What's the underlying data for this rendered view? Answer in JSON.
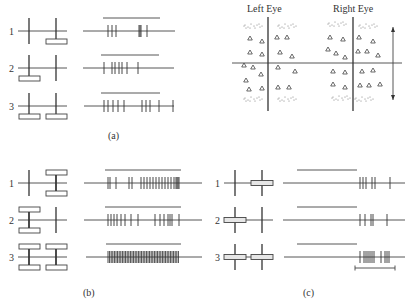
{
  "figure": {
    "panel_labels": {
      "a": "(a)",
      "b": "(b)",
      "c": "(c)"
    },
    "eye_labels": {
      "left": "Left Eye",
      "right": "Right Eye"
    },
    "row_labels": [
      "1",
      "2",
      "3"
    ]
  },
  "panels": {
    "a": {
      "label_pos": [
        115,
        132
      ],
      "rows": [
        {
          "y": 31,
          "label": "1",
          "stim": [
            {
              "x": 29,
              "bar": "none"
            },
            {
              "x": 56,
              "bar": "below"
            }
          ],
          "train": {
            "x1": 83,
            "x2": 175,
            "bar": [
              103,
              160
            ],
            "spikes": [
              108,
              112,
              116,
              139,
              140,
              141,
              147
            ]
          }
        },
        {
          "y": 68,
          "label": "2",
          "stim": [
            {
              "x": 29,
              "bar": "below"
            },
            {
              "x": 56,
              "bar": "none"
            }
          ],
          "train": {
            "x1": 83,
            "x2": 174,
            "bar": [
              101,
              159
            ],
            "spikes": [
              104,
              112,
              115,
              119,
              122,
              127,
              138
            ]
          }
        },
        {
          "y": 106,
          "label": "3",
          "stim": [
            {
              "x": 29,
              "bar": "below"
            },
            {
              "x": 56,
              "bar": "below"
            }
          ],
          "train": {
            "x1": 84,
            "x2": 174,
            "bar": [
              101,
              160
            ],
            "spikes": [
              104,
              108,
              113,
              118,
              124,
              142,
              146,
              150,
              159,
              173
            ]
          }
        }
      ],
      "stim_style": "a"
    },
    "b": {
      "label_pos": [
        90,
        290
      ],
      "rows": [
        {
          "y": 183,
          "label": "1",
          "stim": [
            {
              "x": 29,
              "bar": "none"
            },
            {
              "x": 56,
              "bar": "both"
            }
          ],
          "train": {
            "x1": 84,
            "x2": 202,
            "bar": [
              105,
              181
            ],
            "spikes": [
              108,
              110,
              116,
              129,
              132,
              141,
              144,
              147,
              150,
              153,
              156,
              159,
              162,
              165,
              168,
              171,
              174,
              176,
              177,
              178,
              179
            ]
          }
        },
        {
          "y": 220,
          "label": "2",
          "stim": [
            {
              "x": 29,
              "bar": "both"
            },
            {
              "x": 56,
              "bar": "none"
            }
          ],
          "train": {
            "x1": 84,
            "x2": 202,
            "bar": [
              105,
              181
            ],
            "spikes": [
              108,
              111,
              114,
              117,
              121,
              125,
              131,
              138,
              155,
              160,
              164,
              168,
              170,
              172,
              179
            ]
          }
        },
        {
          "y": 257,
          "label": "3",
          "stim": [
            {
              "x": 29,
              "bar": "both"
            },
            {
              "x": 56,
              "bar": "both"
            }
          ],
          "train": {
            "x1": 86,
            "x2": 202,
            "bar": [
              106,
              181
            ],
            "spikes_range": [
              108,
              179,
              1.6
            ]
          }
        }
      ],
      "stim_style": "b"
    },
    "c": {
      "label_pos": [
        310,
        290
      ],
      "rows": [
        {
          "y": 183,
          "label": "1",
          "stim": [
            {
              "x": 235,
              "bar": "none"
            },
            {
              "x": 262,
              "bar": "center"
            }
          ],
          "train": {
            "x1": 283,
            "x2": 405,
            "bar": [
              297,
              357
            ],
            "spikes": [
              360,
              363,
              366,
              372,
              375,
              390
            ]
          }
        },
        {
          "y": 220,
          "label": "2",
          "stim": [
            {
              "x": 235,
              "bar": "center"
            },
            {
              "x": 262,
              "bar": "none"
            }
          ],
          "train": {
            "x1": 283,
            "x2": 405,
            "bar": [
              297,
              357
            ],
            "spikes": [
              360,
              365,
              371,
              373,
              387
            ]
          }
        },
        {
          "y": 257,
          "label": "3",
          "stim": [
            {
              "x": 235,
              "bar": "center"
            },
            {
              "x": 262,
              "bar": "center"
            }
          ],
          "train": {
            "x1": 284,
            "x2": 405,
            "bar": [
              297,
              357
            ],
            "spikes": [
              360,
              364,
              366,
              368,
              370,
              372,
              374,
              381,
              385,
              387,
              389
            ]
          }
        }
      ],
      "scale_bar": {
        "x1": 355,
        "x2": 395,
        "y": 268
      },
      "stim_style": "c"
    }
  },
  "binocular": {
    "horizontal_line": {
      "x1": 232,
      "x2": 402,
      "y": 63
    },
    "left_vertical": {
      "x": 268,
      "y1": 17,
      "y2": 111
    },
    "right_vertical": {
      "x": 353,
      "y1": 17,
      "y2": 111
    },
    "arrow": {
      "x": 393,
      "y1": 27,
      "y2": 100
    },
    "left_triangles": [
      [
        250,
        38
      ],
      [
        262,
        41
      ],
      [
        277,
        37
      ],
      [
        287,
        37
      ],
      [
        250,
        52
      ],
      [
        262,
        54
      ],
      [
        280,
        52
      ],
      [
        292,
        56
      ],
      [
        244,
        65
      ],
      [
        253,
        67
      ],
      [
        261,
        74
      ],
      [
        278,
        67
      ],
      [
        295,
        71
      ],
      [
        246,
        80
      ],
      [
        249,
        89
      ],
      [
        262,
        88
      ],
      [
        278,
        87
      ],
      [
        289,
        87
      ]
    ],
    "right_triangles": [
      [
        330,
        37
      ],
      [
        343,
        39
      ],
      [
        359,
        37
      ],
      [
        373,
        41
      ],
      [
        328,
        49
      ],
      [
        336,
        53
      ],
      [
        345,
        57
      ],
      [
        358,
        51
      ],
      [
        367,
        51
      ],
      [
        378,
        55
      ],
      [
        333,
        71
      ],
      [
        345,
        72
      ],
      [
        362,
        71
      ],
      [
        373,
        70
      ],
      [
        333,
        84
      ],
      [
        345,
        87
      ],
      [
        360,
        85
      ],
      [
        369,
        85
      ],
      [
        380,
        84
      ]
    ],
    "left_dot_clusters": [
      [
        253,
        26
      ],
      [
        287,
        26
      ],
      [
        253,
        99
      ],
      [
        287,
        99
      ]
    ],
    "right_dot_clusters": [
      [
        337,
        24
      ],
      [
        368,
        26
      ],
      [
        341,
        98
      ],
      [
        364,
        99
      ]
    ]
  }
}
